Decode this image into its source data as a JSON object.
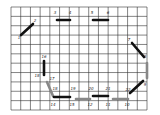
{
  "grid": {
    "x0": 11,
    "y0": 7,
    "x1": 147,
    "y1": 110,
    "cols": 14,
    "rows": 11,
    "line_color": "#333333"
  },
  "segments": [
    {
      "from": "1",
      "to": "2",
      "x1": 21,
      "y1": 35,
      "x2": 33,
      "y2": 24,
      "color": "#111111",
      "width": 2.6
    },
    {
      "from": "3",
      "to": "4",
      "x1": 57,
      "y1": 20,
      "x2": 70,
      "y2": 20,
      "color": "#111111",
      "width": 2.6
    },
    {
      "from": "5",
      "to": "6",
      "x1": 93,
      "y1": 20,
      "x2": 108,
      "y2": 20,
      "color": "#111111",
      "width": 2.6
    },
    {
      "from": "7",
      "to": "8",
      "x1": 132,
      "y1": 43,
      "x2": 144,
      "y2": 57,
      "color": "#111111",
      "width": 2.6
    },
    {
      "from": "8",
      "to": "9",
      "x1": 147,
      "y1": 63,
      "x2": 147,
      "y2": 78,
      "color": "#888888",
      "width": 2.6
    },
    {
      "from": "9",
      "to": "22",
      "x1": 143,
      "y1": 81,
      "x2": 130,
      "y2": 93,
      "color": "#111111",
      "width": 2.6
    },
    {
      "from": "16",
      "to": "18",
      "x1": 44,
      "y1": 61,
      "x2": 44,
      "y2": 75,
      "color": "#111111",
      "width": 2.6
    },
    {
      "from": "17",
      "to": "14",
      "x1": 47,
      "y1": 82,
      "x2": 53,
      "y2": 96,
      "color": "#888888",
      "width": 2.6
    },
    {
      "from": "14",
      "to": "15",
      "x1": 54,
      "y1": 97,
      "x2": 70,
      "y2": 97,
      "color": "#111111",
      "width": 2.6
    },
    {
      "from": "15",
      "to": "12",
      "x1": 76,
      "y1": 99,
      "x2": 90,
      "y2": 99,
      "color": "#888888",
      "width": 2.6
    },
    {
      "from": "20",
      "to": "21",
      "x1": 93,
      "y1": 96,
      "x2": 108,
      "y2": 96,
      "color": "#111111",
      "width": 2.6
    },
    {
      "from": "11",
      "to": "10",
      "x1": 113,
      "y1": 99,
      "x2": 128,
      "y2": 99,
      "color": "#888888",
      "width": 2.6
    }
  ],
  "labels": [
    {
      "text": "1",
      "x": 19,
      "y": 38
    },
    {
      "text": "2",
      "x": 35,
      "y": 21
    },
    {
      "text": "3",
      "x": 55,
      "y": 13
    },
    {
      "text": "4",
      "x": 70,
      "y": 13
    },
    {
      "text": "5",
      "x": 92,
      "y": 13
    },
    {
      "text": "6",
      "x": 108,
      "y": 13
    },
    {
      "text": "7",
      "x": 129,
      "y": 40
    },
    {
      "text": "8",
      "x": 145,
      "y": 57
    },
    {
      "text": "9",
      "x": 145,
      "y": 85
    },
    {
      "text": "10",
      "x": 127,
      "y": 105
    },
    {
      "text": "11",
      "x": 108,
      "y": 105
    },
    {
      "text": "12",
      "x": 90,
      "y": 105
    },
    {
      "text": "15",
      "x": 72,
      "y": 105
    },
    {
      "text": "14",
      "x": 53,
      "y": 105
    },
    {
      "text": "16",
      "x": 44,
      "y": 57
    },
    {
      "text": "18",
      "x": 37,
      "y": 76
    },
    {
      "text": "17",
      "x": 52,
      "y": 79
    },
    {
      "text": "18",
      "x": 55,
      "y": 89
    },
    {
      "text": "19",
      "x": 73,
      "y": 89
    },
    {
      "text": "20",
      "x": 91,
      "y": 89
    },
    {
      "text": "21",
      "x": 108,
      "y": 89
    },
    {
      "text": "22",
      "x": 128,
      "y": 90
    }
  ]
}
